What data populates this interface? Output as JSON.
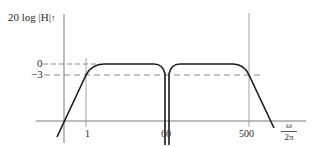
{
  "diagram": {
    "type": "bode-magnitude-plot",
    "y_axis": {
      "label": "20 log |H|",
      "arrow_glyph": "↑"
    },
    "x_axis": {
      "label_numerator": "ω",
      "label_denominator": "2π"
    },
    "y_ticks": [
      {
        "label": "0",
        "value_db": 0
      },
      {
        "label": "−3",
        "value_db": -3
      }
    ],
    "x_ticks": [
      {
        "label": "1",
        "value": 1
      },
      {
        "label": "60",
        "value": 60
      },
      {
        "label": "500",
        "value": 500
      }
    ],
    "features": {
      "lower_cutoff": "1",
      "notch_frequency": "60",
      "upper_cutoff": "500",
      "passband_level_db": "0",
      "cutoff_level_db": "−3"
    },
    "colors": {
      "curve": "#1a1a1a",
      "axes": "#6b6b6b",
      "dashed": "#7a7a7a",
      "text": "#2b2b2b"
    }
  }
}
